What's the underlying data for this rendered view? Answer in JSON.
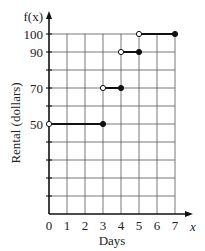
{
  "chart_data": {
    "type": "line",
    "subtype": "step",
    "title": "",
    "xlabel": "Days",
    "ylabel": "Rental (dollars)",
    "x_axis_symbol": "x",
    "y_axis_symbol": "f(x)",
    "xlim": [
      0,
      7
    ],
    "ylim": [
      0,
      100
    ],
    "x_ticks": [
      0,
      1,
      2,
      3,
      4,
      5,
      6,
      7
    ],
    "x_tick_labels": [
      "0",
      "1",
      "2",
      "3",
      "4",
      "5",
      "6",
      "7"
    ],
    "y_ticks": [
      0,
      10,
      20,
      30,
      40,
      50,
      60,
      70,
      80,
      90,
      100
    ],
    "y_tick_labels": [
      "",
      "",
      "",
      "",
      "",
      "50",
      "",
      "70",
      "",
      "90",
      "100"
    ],
    "grid": true,
    "series": [
      {
        "name": "f(x)",
        "segments": [
          {
            "x_start": 0,
            "x_end": 3,
            "y": 50,
            "start_closed": false,
            "end_closed": true
          },
          {
            "x_start": 3,
            "x_end": 4,
            "y": 70,
            "start_closed": false,
            "end_closed": true
          },
          {
            "x_start": 4,
            "x_end": 5,
            "y": 90,
            "start_closed": false,
            "end_closed": true
          },
          {
            "x_start": 5,
            "x_end": 7,
            "y": 100,
            "start_closed": false,
            "end_closed": true
          }
        ]
      }
    ]
  }
}
